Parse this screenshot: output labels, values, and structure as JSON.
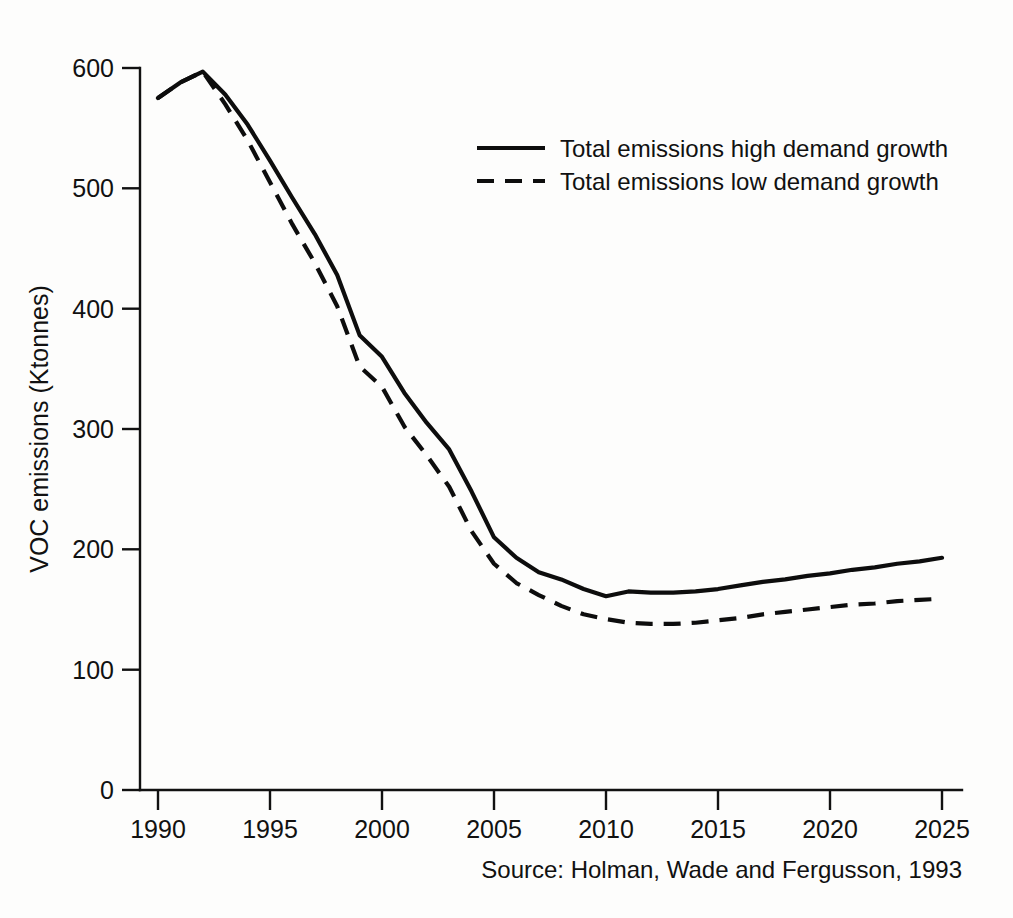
{
  "chart_data": {
    "type": "line",
    "title": "",
    "xlabel": "",
    "ylabel": "VOC emissions (Ktonnes)",
    "xlim": [
      1990,
      2025
    ],
    "ylim": [
      0,
      600
    ],
    "xticks": [
      1990,
      1995,
      2000,
      2005,
      2010,
      2015,
      2020,
      2025
    ],
    "yticks": [
      0,
      100,
      200,
      300,
      400,
      500,
      600
    ],
    "grid": false,
    "legend_position": "upper-center",
    "source": "Source: Holman, Wade and Fergusson, 1993",
    "x": [
      1990,
      1991,
      1992,
      1993,
      1994,
      1995,
      1996,
      1997,
      1998,
      1999,
      2000,
      2001,
      2002,
      2003,
      2004,
      2005,
      2006,
      2007,
      2008,
      2009,
      2010,
      2011,
      2012,
      2013,
      2014,
      2015,
      2016,
      2017,
      2018,
      2019,
      2020,
      2021,
      2022,
      2023,
      2024,
      2025
    ],
    "series": [
      {
        "name": "Total emissions high demand growth",
        "style": "solid",
        "values": [
          575,
          588,
          597,
          578,
          553,
          523,
          492,
          462,
          428,
          378,
          360,
          330,
          305,
          283,
          248,
          210,
          193,
          181,
          175,
          167,
          161,
          165,
          164,
          164,
          165,
          167,
          170,
          173,
          175,
          178,
          180,
          183,
          185,
          188,
          190,
          193
        ]
      },
      {
        "name": "Total emissions low demand growth",
        "style": "dashed",
        "values": [
          575,
          588,
          597,
          570,
          540,
          505,
          470,
          438,
          402,
          352,
          335,
          302,
          278,
          252,
          215,
          188,
          172,
          162,
          153,
          146,
          142,
          139,
          138,
          138,
          139,
          141,
          143,
          146,
          148,
          150,
          152,
          154,
          155,
          157,
          158,
          159
        ]
      }
    ]
  },
  "axes": {
    "y_title": "VOC emissions (Ktonnes)",
    "y_tick_labels": [
      "0",
      "100",
      "200",
      "300",
      "400",
      "500",
      "600"
    ],
    "x_tick_labels": [
      "1990",
      "1995",
      "2000",
      "2005",
      "2010",
      "2015",
      "2020",
      "2025"
    ]
  },
  "legend": {
    "entries": [
      {
        "label": "Total emissions high demand growth",
        "style": "solid"
      },
      {
        "label": "Total emissions low demand growth",
        "style": "dashed"
      }
    ]
  },
  "footer": {
    "source": "Source: Holman, Wade and Fergusson, 1993"
  }
}
